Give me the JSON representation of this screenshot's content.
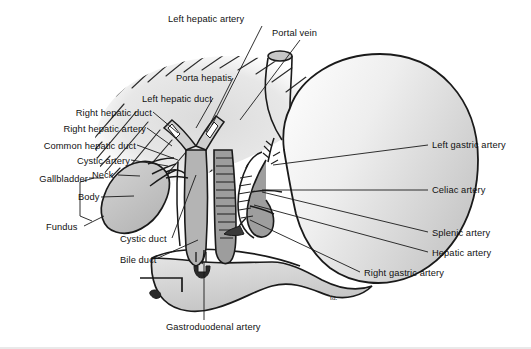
{
  "figure": {
    "signature": "td.",
    "background_color": "#ffffff",
    "outline_color": "#1a1a1a",
    "organ_fill": "#b9b9b9",
    "vessel_fill": "#8f8f8f",
    "liver_hatch_color": "#2b2b2b",
    "border_color": "#e9e9e9"
  },
  "labels": [
    {
      "id": "left-hepatic-artery",
      "text": "Left hepatic artery",
      "side": "r",
      "x": 168,
      "y": 14,
      "lx": 262,
      "ly": 26,
      "tx": 212,
      "ty": 125
    },
    {
      "id": "portal-vein",
      "text": "Portal vein",
      "side": "r",
      "x": 272,
      "y": 28,
      "lx": 300,
      "ly": 40,
      "tx": 240,
      "ty": 120
    },
    {
      "id": "porta-hepatis",
      "text": "Porta hepatis",
      "side": "l",
      "x": 232,
      "y": 73,
      "lx": 233,
      "ly": 78,
      "tx": 206,
      "ty": 132
    },
    {
      "id": "left-hepatic-duct",
      "text": "Left hepatic duct",
      "side": "l",
      "x": 212,
      "y": 94,
      "lx": 213,
      "ly": 98,
      "tx": 196,
      "ty": 128
    },
    {
      "id": "right-hepatic-duct",
      "text": "Right hepatic duct",
      "side": "l",
      "x": 152,
      "y": 108,
      "lx": 153,
      "ly": 112,
      "tx": 178,
      "ty": 133
    },
    {
      "id": "right-hepatic-artery",
      "text": "Right hepatic artery",
      "side": "l",
      "x": 146,
      "y": 124,
      "lx": 147,
      "ly": 128,
      "tx": 172,
      "ty": 146
    },
    {
      "id": "common-hepatic-duct",
      "text": "Common hepatic duct",
      "side": "l",
      "x": 136,
      "y": 141,
      "lx": 137,
      "ly": 145,
      "tx": 178,
      "ty": 160
    },
    {
      "id": "cystic-artery",
      "text": "Cystic artery",
      "side": "l",
      "x": 130,
      "y": 156,
      "lx": 131,
      "ly": 160,
      "tx": 168,
      "ty": 166
    },
    {
      "id": "neck",
      "text": "Neck",
      "side": "r",
      "x": 92,
      "y": 170,
      "lx": 118,
      "ly": 175,
      "tx": 140,
      "ty": 176
    },
    {
      "id": "gallbladder",
      "text": "Gallbladder",
      "side": "l",
      "x": 88,
      "y": 174,
      "lx": 89,
      "ly": 178,
      "tx": 104,
      "ty": 178
    },
    {
      "id": "body",
      "text": "Body",
      "side": "r",
      "x": 78,
      "y": 192,
      "lx": 101,
      "ly": 197,
      "tx": 134,
      "ty": 196
    },
    {
      "id": "fundus",
      "text": "Fundus",
      "side": "r",
      "x": 46,
      "y": 222,
      "lx": 84,
      "ly": 226,
      "tx": 104,
      "ty": 216
    },
    {
      "id": "cystic-duct",
      "text": "Cystic duct",
      "side": "r",
      "x": 120,
      "y": 234,
      "lx": 172,
      "ly": 238,
      "tx": 196,
      "ty": 175
    },
    {
      "id": "bile-duct",
      "text": "Bile duct",
      "side": "r",
      "x": 120,
      "y": 255,
      "lx": 158,
      "ly": 258,
      "tx": 198,
      "ty": 240
    },
    {
      "id": "gastroduodenal-artery",
      "text": "Gastroduodenal artery",
      "side": "r",
      "x": 166,
      "y": 322,
      "lx": 204,
      "ly": 320,
      "tx": 204,
      "ty": 262
    },
    {
      "id": "left-gastric-artery",
      "text": "Left gastric artery",
      "side": "r",
      "x": 432,
      "y": 140,
      "lx": 428,
      "ly": 145,
      "tx": 273,
      "ty": 165
    },
    {
      "id": "celiac-artery",
      "text": "Celiac artery",
      "side": "r",
      "x": 432,
      "y": 185,
      "lx": 428,
      "ly": 190,
      "tx": 262,
      "ty": 190
    },
    {
      "id": "splenic-artery",
      "text": "Splenic artery",
      "side": "r",
      "x": 432,
      "y": 228,
      "lx": 428,
      "ly": 232,
      "tx": 262,
      "ty": 192
    },
    {
      "id": "hepatic-artery",
      "text": "Hepatic artery",
      "side": "r",
      "x": 432,
      "y": 248,
      "lx": 428,
      "ly": 252,
      "tx": 254,
      "ty": 205
    },
    {
      "id": "right-gastric-artery",
      "text": "Right gastric artery",
      "side": "r",
      "x": 364,
      "y": 268,
      "lx": 360,
      "ly": 272,
      "tx": 250,
      "ty": 220
    }
  ],
  "structures": [
    {
      "id": "liver",
      "name": "liver-cut-surface"
    },
    {
      "id": "stomach",
      "name": "stomach"
    },
    {
      "id": "esophagus",
      "name": "esophagus"
    },
    {
      "id": "duodenum",
      "name": "duodenum"
    },
    {
      "id": "gallbladder-organ",
      "name": "gallbladder"
    },
    {
      "id": "bile-duct-organ",
      "name": "bile-duct"
    },
    {
      "id": "celiac-trunk",
      "name": "celiac-trunk"
    }
  ]
}
